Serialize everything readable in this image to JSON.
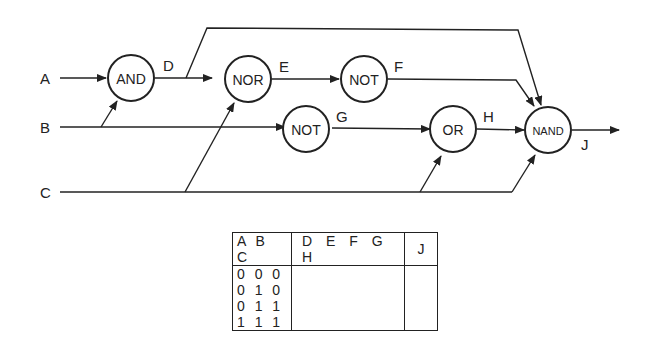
{
  "diagram": {
    "inputs": [
      "A",
      "B",
      "C"
    ],
    "gates": [
      {
        "id": "and",
        "label": "AND",
        "output": "D"
      },
      {
        "id": "nor",
        "label": "NOR",
        "output": "E"
      },
      {
        "id": "not1",
        "label": "NOT",
        "output": "F"
      },
      {
        "id": "not2",
        "label": "NOT",
        "output": "G"
      },
      {
        "id": "or",
        "label": "OR",
        "output": "H"
      },
      {
        "id": "nand",
        "label": "NAND",
        "output": "J"
      }
    ],
    "signal_labels": {
      "D": "D",
      "E": "E",
      "F": "F",
      "G": "G",
      "H": "H",
      "J": "J"
    }
  },
  "truth_table": {
    "headers": {
      "inputs": "A B C",
      "intermediates": "D E F G H",
      "output": "J"
    },
    "rows": [
      {
        "inputs": "0 0 0",
        "intermediates": "",
        "output": ""
      },
      {
        "inputs": "0 1 0",
        "intermediates": "",
        "output": ""
      },
      {
        "inputs": "0 1 1",
        "intermediates": "",
        "output": ""
      },
      {
        "inputs": "1 1 1",
        "intermediates": "",
        "output": ""
      }
    ]
  }
}
